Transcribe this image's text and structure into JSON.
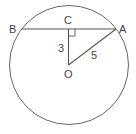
{
  "diagram": {
    "points": {
      "B": {
        "label": "B"
      },
      "A": {
        "label": "A"
      },
      "C": {
        "label": "C"
      },
      "O": {
        "label": "O"
      }
    },
    "lengths": {
      "OC": "3",
      "OA": "5"
    },
    "colors": {
      "stroke": "#555555",
      "text": "#444444",
      "background": "#ffffff"
    }
  }
}
